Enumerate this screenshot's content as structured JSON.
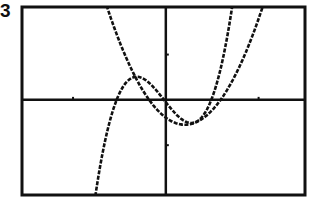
{
  "figure_label": "3",
  "colors": {
    "ink": "#111111",
    "background": "#ffffff"
  },
  "frame_px": {
    "left": 22,
    "top": 7,
    "right": 305,
    "bottom": 195
  },
  "chart_data": {
    "type": "line",
    "title": "",
    "xlabel": "",
    "ylabel": "",
    "xlim": [
      -1.55,
      1.5
    ],
    "ylim": [
      -2.1,
      2.05
    ],
    "grid": false,
    "axes_visible": true,
    "x_ticks": [
      -1,
      1
    ],
    "y_ticks": [
      -1,
      1
    ],
    "series": [
      {
        "name": "cubic",
        "form": "a*(x-r1)*(x-r2)*(x-r3)",
        "coefficients": {
          "a": 10,
          "r1": -0.53,
          "r2": -0.02,
          "r3": 0.49
        },
        "style": "dotted-pixel",
        "x": [
          -0.76,
          -0.6,
          -0.53,
          -0.4,
          -0.31,
          -0.2,
          -0.02,
          0.1,
          0.19,
          0.3,
          0.49,
          0.6,
          0.71
        ],
        "y": [
          -2.13,
          -0.59,
          0.0,
          0.48,
          0.51,
          0.34,
          0.0,
          -0.34,
          -0.45,
          -0.36,
          0.0,
          0.78,
          1.99
        ]
      },
      {
        "name": "parabola",
        "form": "k*(x-r1)*(x-r2)",
        "coefficients": {
          "k": 3.7,
          "r1": -0.18,
          "r2": 0.59
        },
        "style": "dotted-pixel",
        "x": [
          -0.59,
          -0.4,
          -0.18,
          0.0,
          0.205,
          0.4,
          0.59,
          0.8,
          1.0
        ],
        "y": [
          1.79,
          0.8,
          0.0,
          -0.39,
          -0.55,
          -0.41,
          0.0,
          0.76,
          1.79
        ]
      }
    ]
  }
}
